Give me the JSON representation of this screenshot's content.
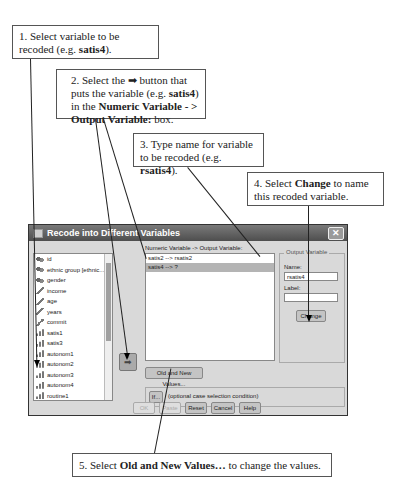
{
  "callouts": {
    "step1": {
      "prefix": "1. Select variable to be recoded (e.g. ",
      "bold": "satis4",
      "suffix": ")."
    },
    "step2": {
      "prefix": "2. Select the ",
      "glyph": "➡",
      "mid": " button that puts the variable (e.g. ",
      "bold1": "satis4",
      "mid2": ") in the ",
      "bold2": "Numeric Variable - > Output Variable:",
      "suffix": " box."
    },
    "step3": {
      "prefix": "3. Type name for variable to be recoded (e.g. ",
      "bold": "rsatis4",
      "suffix": ")."
    },
    "step4": {
      "prefix": "4. Select ",
      "bold": "Change",
      "suffix": " to name this recoded variable."
    },
    "step5": {
      "prefix": "5. Select ",
      "bold": "Old and New Values…",
      "suffix": " to change the values."
    }
  },
  "dialog": {
    "title": "Recode into Different Variables",
    "close_icon": "close-icon",
    "variables": [
      {
        "name": "id",
        "type": "nominal"
      },
      {
        "name": "ethnic group [ethnic...",
        "type": "nominal"
      },
      {
        "name": "gender",
        "type": "nominal"
      },
      {
        "name": "income",
        "type": "scale"
      },
      {
        "name": "age",
        "type": "scale"
      },
      {
        "name": "years",
        "type": "scale"
      },
      {
        "name": "commit",
        "type": "scale"
      },
      {
        "name": "satis1",
        "type": "ordinal"
      },
      {
        "name": "satis3",
        "type": "ordinal"
      },
      {
        "name": "autonom1",
        "type": "ordinal"
      },
      {
        "name": "autonom2",
        "type": "ordinal"
      },
      {
        "name": "autonom3",
        "type": "ordinal"
      },
      {
        "name": "autonom4",
        "type": "ordinal"
      },
      {
        "name": "routine1",
        "type": "ordinal"
      }
    ],
    "move_button_glyph": "➡",
    "numeric_output_label": "Numeric Variable -> Output Variable:",
    "numeric_output_rows": [
      "satis2 --> rsatis2",
      "satis4 --> ?"
    ],
    "output_variable": {
      "legend": "Output Variable",
      "name_label": "Name:",
      "name_value": "rsatis4",
      "label_label": "Label:",
      "label_value": "",
      "change_button": "Change"
    },
    "old_new_button": "Old and New Values...",
    "if_button": "If...",
    "if_text": "(optional case selection condition)",
    "buttons": {
      "ok": "OK",
      "paste": "Paste",
      "reset": "Reset",
      "cancel": "Cancel",
      "help": "Help"
    }
  }
}
